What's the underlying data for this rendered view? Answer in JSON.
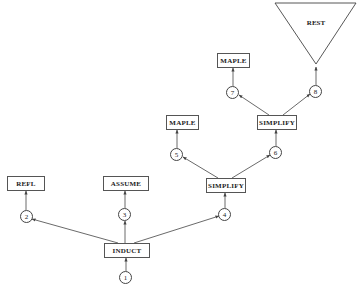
{
  "diagram": {
    "type": "proof-tree",
    "colors": {
      "line": "#444444",
      "background": "#ffffff",
      "text": "#222222"
    },
    "nodes": {
      "induct": {
        "label": "INDUCT"
      },
      "refl": {
        "label": "REFL"
      },
      "assume": {
        "label": "ASSUME"
      },
      "simplify1": {
        "label": "SIMPLIFY"
      },
      "maple1": {
        "label": "MAPLE"
      },
      "simplify2": {
        "label": "SIMPLIFY"
      },
      "maple2": {
        "label": "MAPLE"
      },
      "rest": {
        "label": "REST"
      }
    },
    "branches": {
      "b1": {
        "label": "1"
      },
      "b2": {
        "label": "2"
      },
      "b3": {
        "label": "3"
      },
      "b4": {
        "label": "4"
      },
      "b5": {
        "label": "5"
      },
      "b6": {
        "label": "6"
      },
      "b7": {
        "label": "7"
      },
      "b8": {
        "label": "8"
      }
    },
    "edges": [
      {
        "from": "b1",
        "to": "induct"
      },
      {
        "from": "induct",
        "to": "b2"
      },
      {
        "from": "induct",
        "to": "b3"
      },
      {
        "from": "induct",
        "to": "b4"
      },
      {
        "from": "b2",
        "to": "refl"
      },
      {
        "from": "b3",
        "to": "assume"
      },
      {
        "from": "b4",
        "to": "simplify1"
      },
      {
        "from": "simplify1",
        "to": "b5"
      },
      {
        "from": "simplify1",
        "to": "b6"
      },
      {
        "from": "b5",
        "to": "maple1"
      },
      {
        "from": "b6",
        "to": "simplify2"
      },
      {
        "from": "simplify2",
        "to": "b7"
      },
      {
        "from": "simplify2",
        "to": "b8"
      },
      {
        "from": "b7",
        "to": "maple2"
      },
      {
        "from": "b8",
        "to": "rest"
      }
    ]
  }
}
